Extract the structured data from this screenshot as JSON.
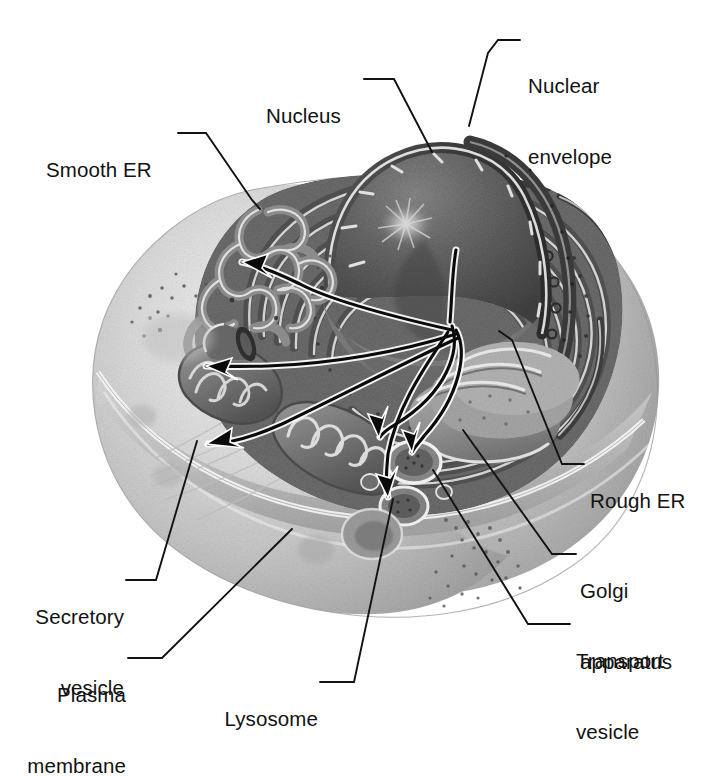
{
  "figure": {
    "kind": "grayscale-airbrush-illustration",
    "background_color": "#ffffff",
    "ink_color": "#121212",
    "top_cropped_caption_trace": "  ",
    "palette": {
      "cytoplasm_light": "#d9d9d9",
      "cytoplasm_mid": "#b4b4b4",
      "cytoplasm_shadow": "#8d8d8d",
      "membrane_highlight": "#f2f2f2",
      "er_dark": "#585858",
      "er_mid": "#7c7c7c",
      "nucleus_dark": "#4c4c4c",
      "nucleus_mid": "#6e6e6e",
      "nucleolus": "#cfcfcf",
      "envelope_dark": "#3a3a3a",
      "golgi_mid": "#9a9a9a",
      "arrow_black": "#0a0a0a"
    }
  },
  "labels": [
    {
      "id": "smooth-er",
      "text": "Smooth ER",
      "lines": [
        "Smooth ER"
      ],
      "align": "left",
      "x": 46,
      "y": 122,
      "dash_from": [
        175,
        133
      ],
      "dash_to": [
        205,
        133
      ],
      "leader": "M205,133 L250,200 L258,208"
    },
    {
      "id": "nucleus",
      "text": "Nucleus",
      "lines": [
        "Nucleus"
      ],
      "align": "left",
      "x": 266,
      "y": 68,
      "dash_from": [
        362,
        79
      ],
      "dash_to": [
        392,
        79
      ],
      "leader": "M392,79 L430,150"
    },
    {
      "id": "nuclear-envelope",
      "text": "Nuclear envelope",
      "lines": [
        "Nuclear",
        "envelope"
      ],
      "align": "left",
      "x": 528,
      "y": 28,
      "dash_from": [
        497,
        40
      ],
      "dash_to": [
        520,
        40
      ],
      "leader": "M497,40 L488,52 L468,124"
    },
    {
      "id": "rough-er",
      "text": "Rough ER",
      "lines": [
        "Rough ER"
      ],
      "align": "left",
      "x": 588,
      "y": 452,
      "dash_from": [
        562,
        464
      ],
      "dash_to": [
        584,
        464
      ],
      "leader": "M562,464 L512,340 L498,330"
    },
    {
      "id": "golgi-apparatus",
      "text": "Golgi apparatus",
      "lines": [
        "Golgi",
        "apparatus"
      ],
      "align": "left",
      "x": 578,
      "y": 542,
      "dash_from": [
        552,
        554
      ],
      "dash_to": [
        574,
        554
      ],
      "leader": "M552,554 L462,430"
    },
    {
      "id": "transport-vesicle",
      "text": "Transport vesicle",
      "lines": [
        "Transport",
        "vesicle"
      ],
      "align": "left",
      "x": 574,
      "y": 612,
      "dash_from": [
        528,
        624
      ],
      "dash_to": [
        570,
        624
      ],
      "leader": "M528,624 L432,470"
    },
    {
      "id": "secretory-vesicle",
      "text": "Secretory vesicle",
      "lines": [
        "Secretory",
        "vesicle"
      ],
      "align": "right",
      "x": 30,
      "y": 568,
      "dash_from": [
        125,
        580
      ],
      "dash_to": [
        154,
        580
      ],
      "leader": "M154,580 L196,440"
    },
    {
      "id": "plasma-membrane",
      "text": "Plasma membrane",
      "lines": [
        "Plasma",
        "membrane"
      ],
      "align": "right",
      "x": 48,
      "y": 646,
      "dash_from": [
        126,
        658
      ],
      "dash_to": [
        160,
        658
      ],
      "leader": "M160,658 L290,528"
    },
    {
      "id": "lysosome",
      "text": "Lysosome",
      "lines": [
        "Lysosome"
      ],
      "align": "right",
      "x": 208,
      "y": 670,
      "dash_from": [
        318,
        682
      ],
      "dash_to": [
        352,
        682
      ],
      "leader": "M352,682 L392,498"
    }
  ],
  "arrows": {
    "description": "black flow arrows from rough ER to destinations",
    "count": 5,
    "origin": [
      455,
      330
    ],
    "targets": [
      {
        "id": "arrow-to-smooth-er",
        "tip": [
          236,
          262
        ],
        "note": "up-left to smooth ER"
      },
      {
        "id": "arrow-to-secretory",
        "tip": [
          203,
          366
        ],
        "note": "left to secretory vesicle / mitochondrion area"
      },
      {
        "id": "arrow-to-plasma",
        "tip": [
          205,
          444
        ],
        "note": "down-left to plasma membrane"
      },
      {
        "id": "arrow-to-transport-1",
        "tip": [
          378,
          437
        ],
        "note": "short down to transport vesicle"
      },
      {
        "id": "arrow-to-golgi",
        "tip": [
          412,
          452
        ],
        "note": "down to golgi vesicle"
      },
      {
        "id": "arrow-to-lysosome",
        "tip": [
          388,
          497
        ],
        "note": "down to lysosome"
      }
    ]
  },
  "structures": [
    {
      "id": "cell-body",
      "name": "cell outline",
      "note": "broad bean/kidney shaped cell, pale grey, occupying x 85-658, y 180-620"
    },
    {
      "id": "nucleus",
      "name": "nucleus",
      "note": "cut-away dome, dark stippled chromatin, central nucleolus starburst"
    },
    {
      "id": "nuclear-envelope",
      "name": "nuclear envelope",
      "note": "double membrane rim with nuclear pores along right flank"
    },
    {
      "id": "rough-er",
      "name": "rough endoplasmic reticulum",
      "note": "concentric ribosome-studded cisternae wrapping nucleus"
    },
    {
      "id": "smooth-er",
      "name": "smooth endoplasmic reticulum",
      "note": "tubular lace network at upper left of cell"
    },
    {
      "id": "golgi",
      "name": "golgi apparatus",
      "note": "stacked flattened sacs at lower right"
    },
    {
      "id": "mitochondria",
      "name": "mitochondria",
      "note": "two cristae-filled organelles at left and lower-centre"
    },
    {
      "id": "lysosome",
      "name": "lysosome",
      "note": "dense round vesicle lower centre"
    },
    {
      "id": "secretory-vesicle",
      "name": "secretory vesicle",
      "note": "vesicle fusing with plasma membrane, upper left"
    },
    {
      "id": "transport-vesicles",
      "name": "transport vesicles",
      "note": "small round vesicles near golgi"
    },
    {
      "id": "cytoskeleton",
      "name": "cytoskeletal filaments",
      "note": "faint striations in left cytoplasm"
    },
    {
      "id": "ribosome-stipple",
      "name": "free ribosomes",
      "note": "fine dark dot clusters in cytoplasm and on ER"
    }
  ]
}
